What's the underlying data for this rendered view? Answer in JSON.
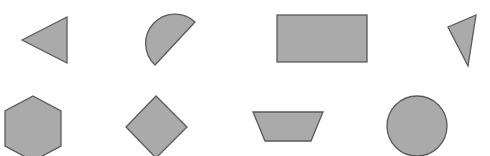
{
  "canvas": {
    "width": 490,
    "height": 156,
    "background": "#ffffff"
  },
  "style": {
    "fill": "#aaaaaa",
    "stroke": "#5a5a5a"
  },
  "shapes": [
    {
      "name": "triangle",
      "points": "22,40 67,17 67,63"
    },
    {
      "name": "semicircle",
      "path": "M195,22 A29,29 0 0 0 155,65 Z"
    },
    {
      "name": "rectangle",
      "x": 277,
      "y": 15,
      "width": 90,
      "height": 47
    },
    {
      "name": "narrow-triangle",
      "points": "448,27 476,15 468,66"
    },
    {
      "name": "hexagon",
      "points": "33,96 61,111 61,146 33,161 5,146 5,111"
    },
    {
      "name": "diamond",
      "points": "156,96 187,127 156,158 126,127"
    },
    {
      "name": "trapezoid",
      "points": "253,112 323,112 311,141 265,141"
    },
    {
      "name": "circle",
      "cx": 417,
      "cy": 126,
      "r": 30
    }
  ]
}
